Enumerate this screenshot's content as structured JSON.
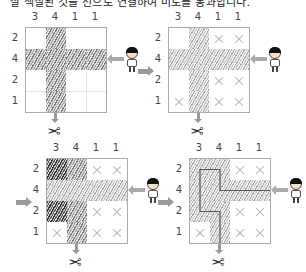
{
  "caption": "잘 색칠된 것을 선으로 연결하여 미로를 통과합니다.",
  "column_clues": [
    "3",
    "4",
    "1",
    "1"
  ],
  "row_clues": [
    "2",
    "4",
    "2",
    "1"
  ],
  "icons": {
    "entry_character": "boy-character-icon",
    "exit_marker": "scissors-icon",
    "step": "right-arrow-icon",
    "marked_empty": "x-mark-icon"
  },
  "colors": {
    "grid_border": "#aaaaaa",
    "hatch_dark": "#333333",
    "hatch_mid": "#7a7a7a",
    "x_mark": "#bbbbbb",
    "path_line": "#555555"
  },
  "panels": [
    {
      "step": 1,
      "cells": [
        [
          "",
          "h",
          "",
          ""
        ],
        [
          "h",
          "h",
          "h",
          "h"
        ],
        [
          "",
          "h",
          "",
          ""
        ],
        [
          "",
          "h",
          "",
          ""
        ]
      ]
    },
    {
      "step": 2,
      "cells": [
        [
          "",
          "l",
          "x",
          "x"
        ],
        [
          "l",
          "l",
          "l",
          "l"
        ],
        [
          "",
          "l",
          "x",
          "x"
        ],
        [
          "x",
          "l",
          "x",
          "x"
        ]
      ]
    },
    {
      "step": 3,
      "cells": [
        [
          "d",
          "h",
          "x",
          "x"
        ],
        [
          "l",
          "l",
          "l",
          "l"
        ],
        [
          "d",
          "h",
          "x",
          "x"
        ],
        [
          "x",
          "h",
          "x",
          "x"
        ]
      ]
    },
    {
      "step": 4,
      "cells": [
        [
          "l",
          "l",
          "x",
          "x"
        ],
        [
          "l",
          "l",
          "l",
          "l"
        ],
        [
          "l",
          "l",
          "x",
          "x"
        ],
        [
          "x",
          "l",
          "x",
          "x"
        ]
      ],
      "solution_path": "enter right of row 2 → left along row 2 to column 2 → up to row 1 → left to column 1 → down to row 3 → right to column 2 → down to exit at bottom"
    }
  ]
}
